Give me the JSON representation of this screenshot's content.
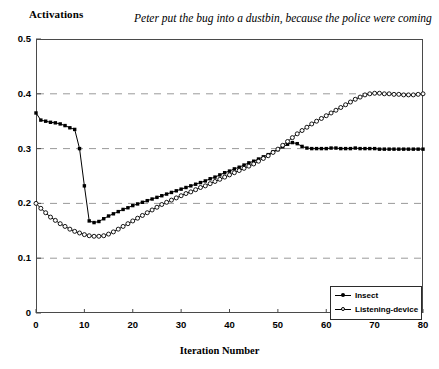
{
  "chart_data": {
    "type": "line",
    "title": "Peter put the bug into a dustbin, because the police were coming",
    "xlabel": "Iteration Number",
    "ylabel": "Activations",
    "xlim": [
      0,
      80
    ],
    "ylim": [
      0,
      0.5
    ],
    "xticks": [
      "0",
      "10",
      "20",
      "30",
      "40",
      "50",
      "60",
      "70",
      "80"
    ],
    "xtick_values": [
      0,
      10,
      20,
      30,
      40,
      50,
      60,
      70,
      80
    ],
    "yticks": [
      "0",
      "0.1",
      "0.2",
      "0.3",
      "0.4",
      "0.5"
    ],
    "ytick_values": [
      0,
      0.1,
      0.2,
      0.3,
      0.4,
      0.5
    ],
    "grid": "horizontal-dashed",
    "legend_position": "bottom-right",
    "x": [
      0,
      1,
      2,
      3,
      4,
      5,
      6,
      7,
      8,
      9,
      10,
      11,
      12,
      13,
      14,
      15,
      16,
      17,
      18,
      19,
      20,
      21,
      22,
      23,
      24,
      25,
      26,
      27,
      28,
      29,
      30,
      31,
      32,
      33,
      34,
      35,
      36,
      37,
      38,
      39,
      40,
      41,
      42,
      43,
      44,
      45,
      46,
      47,
      48,
      49,
      50,
      51,
      52,
      53,
      54,
      55,
      56,
      57,
      58,
      59,
      60,
      61,
      62,
      63,
      64,
      65,
      66,
      67,
      68,
      69,
      70,
      71,
      72,
      73,
      74,
      75,
      76,
      77,
      78,
      79,
      80
    ],
    "series": [
      {
        "name": "Insect",
        "marker": "filled-square",
        "values": [
          0.365,
          0.352,
          0.35,
          0.348,
          0.347,
          0.345,
          0.342,
          0.338,
          0.335,
          0.3,
          0.232,
          0.168,
          0.165,
          0.167,
          0.172,
          0.177,
          0.181,
          0.185,
          0.189,
          0.192,
          0.196,
          0.199,
          0.202,
          0.205,
          0.208,
          0.211,
          0.214,
          0.217,
          0.22,
          0.223,
          0.226,
          0.229,
          0.232,
          0.235,
          0.238,
          0.241,
          0.245,
          0.248,
          0.252,
          0.256,
          0.259,
          0.263,
          0.266,
          0.27,
          0.274,
          0.277,
          0.281,
          0.285,
          0.289,
          0.294,
          0.298,
          0.303,
          0.308,
          0.311,
          0.309,
          0.304,
          0.301,
          0.3,
          0.3,
          0.3,
          0.3,
          0.301,
          0.301,
          0.3,
          0.3,
          0.3,
          0.301,
          0.3,
          0.3,
          0.3,
          0.3,
          0.299,
          0.299,
          0.299,
          0.299,
          0.299,
          0.299,
          0.299,
          0.299,
          0.299,
          0.299
        ]
      },
      {
        "name": "Listening-device",
        "marker": "open-circle",
        "values": [
          0.2,
          0.191,
          0.183,
          0.175,
          0.169,
          0.163,
          0.158,
          0.153,
          0.149,
          0.146,
          0.143,
          0.141,
          0.14,
          0.14,
          0.141,
          0.144,
          0.148,
          0.153,
          0.158,
          0.163,
          0.168,
          0.173,
          0.178,
          0.183,
          0.188,
          0.193,
          0.198,
          0.202,
          0.206,
          0.21,
          0.214,
          0.218,
          0.221,
          0.225,
          0.229,
          0.232,
          0.236,
          0.24,
          0.244,
          0.248,
          0.252,
          0.256,
          0.26,
          0.264,
          0.268,
          0.272,
          0.277,
          0.282,
          0.287,
          0.293,
          0.299,
          0.306,
          0.313,
          0.32,
          0.327,
          0.333,
          0.339,
          0.345,
          0.35,
          0.355,
          0.36,
          0.365,
          0.37,
          0.375,
          0.38,
          0.385,
          0.39,
          0.394,
          0.398,
          0.4,
          0.401,
          0.401,
          0.4,
          0.4,
          0.399,
          0.399,
          0.398,
          0.398,
          0.398,
          0.399,
          0.4
        ]
      }
    ]
  },
  "legend": {
    "items": [
      {
        "label": "Insect"
      },
      {
        "label": "Listening-device"
      }
    ]
  },
  "colors": {
    "series_line": "#000000",
    "grid": "#9a9a9a",
    "frame": "#4a4a4a",
    "background": "#ffffff"
  }
}
